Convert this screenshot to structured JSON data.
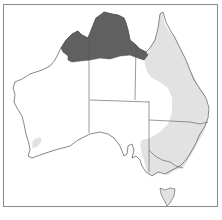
{
  "map": {
    "subject": "Australia species distribution map",
    "colors": {
      "background": "#ffffff",
      "frame_border": "#8a8a8a",
      "outline": "#555555",
      "primary_range": "#606060",
      "secondary_range": "#e2e2e2"
    },
    "regions": [
      {
        "name": "Western Australia",
        "shading": "mostly none; small light patch in south-west; dark in Kimberley north"
      },
      {
        "name": "Northern Territory",
        "shading": "dark in Top End north"
      },
      {
        "name": "Queensland",
        "shading": "dark in Gulf north-west; light across east and centre"
      },
      {
        "name": "South Australia",
        "shading": "light in south-east corner"
      },
      {
        "name": "New South Wales",
        "shading": "light across most of state"
      },
      {
        "name": "Victoria",
        "shading": "light"
      },
      {
        "name": "Tasmania",
        "shading": "light"
      }
    ]
  }
}
